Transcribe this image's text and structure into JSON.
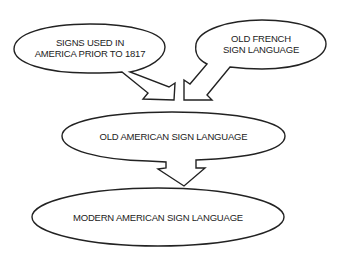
{
  "diagram": {
    "type": "flow",
    "nodes": [
      {
        "id": "signs_america",
        "label_line1": "SIGNS USED IN",
        "label_line2": "AMERICA PRIOR TO 1817"
      },
      {
        "id": "old_french",
        "label_line1": "OLD FRENCH",
        "label_line2": "SIGN LANGUAGE"
      },
      {
        "id": "old_american",
        "label": "OLD AMERICAN SIGN LANGUAGE"
      },
      {
        "id": "modern_american",
        "label": "MODERN AMERICAN SIGN LANGUAGE"
      }
    ],
    "edges": [
      {
        "from": "signs_america",
        "to": "old_american"
      },
      {
        "from": "old_french",
        "to": "old_american"
      },
      {
        "from": "old_american",
        "to": "modern_american"
      }
    ],
    "colors": {
      "stroke": "#222222",
      "fill": "#ffffff",
      "text": "#222222"
    }
  }
}
